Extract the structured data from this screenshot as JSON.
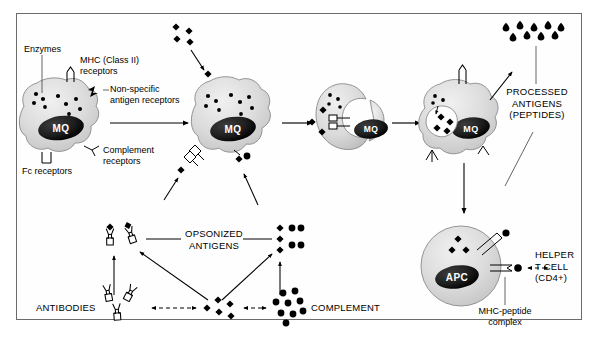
{
  "figure": {
    "background": "#ffffff",
    "frame_color": "#6b6b6b"
  },
  "labels": {
    "enzymes": "Enzymes",
    "mhc_receptors": "MHC (Class II)\nreceptors",
    "nonspecific_receptors": "Non-specific\nantigen receptors",
    "complement_receptors": "Complement\nreceptors",
    "fc_receptors": "Fc receptors",
    "processed_antigens": "PROCESSED\nANTIGENS\n(PEPTIDES)",
    "opsonized_antigens": "OPSONIZED\nANTIGENS",
    "antibodies": "ANTIBODIES",
    "complement": "COMPLEMENT",
    "helper_t_cell": "HELPER\nT CELL\n(CD4+)",
    "mhc_peptide_complex": "MHC-peptide\ncomplex"
  },
  "cells": [
    {
      "id": "macrophage-1",
      "nucleus_label": "MQ",
      "stage": "resting macrophage"
    },
    {
      "id": "macrophage-2",
      "nucleus_label": "MQ",
      "stage": "antigen binding"
    },
    {
      "id": "macrophage-3",
      "nucleus_label": "MQ",
      "stage": "phagocytosis"
    },
    {
      "id": "macrophage-4",
      "nucleus_label": "MQ",
      "stage": "phagosome digestion"
    },
    {
      "id": "apc-cell",
      "nucleus_label": "APC",
      "stage": "antigen presentation"
    }
  ],
  "colors": {
    "cell_fill": "#d8d8d8",
    "cell_fill_light": "#e8e8e8",
    "nucleus": "#1a1a1a",
    "antigen": "#000000",
    "outline": "#4a4a4a",
    "text": "#000000"
  },
  "symbols": {
    "antigen": "black-diamond",
    "complement": "black-circle",
    "antibody": "y-shape-outline",
    "peptide": "black-teardrop",
    "mhc_receptor": "y-receptor",
    "fc_receptor": "u-receptor"
  }
}
